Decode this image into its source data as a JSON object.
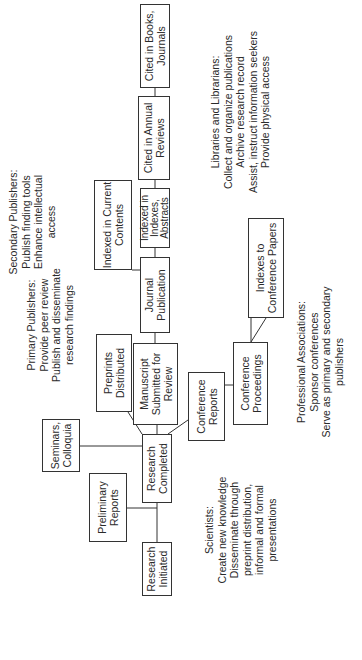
{
  "boxes": {
    "research_initiated": "Research Initiated",
    "preliminary_reports": "Preliminary Reports",
    "seminars": "Seminars, Colloquia",
    "research_completed": "Research Completed",
    "preprints": "Preprints Distributed",
    "manuscript": "Manuscript Submitted for Review",
    "conference_reports": "Conference Reports",
    "conference_proceedings": "Conference Proceedings",
    "indexes_conference": "Indexes to Conference Papers",
    "journal_publication": "Journal Publication",
    "current_contents": "Indexed in Current Contents",
    "indexes_abstracts": "Indexed in Indexes, Abstracts",
    "annual_reviews": "Cited in Annual Reviews",
    "books_journals": "Cited in Books, Journals"
  },
  "notes": {
    "scientists": {
      "title": "Scientists:",
      "lines": [
        "Create new knowledge",
        "Disseminate through",
        "preprint distribution,",
        "informal and formal",
        "presentations"
      ]
    },
    "primary": {
      "title": "Primary Publishers:",
      "lines": [
        "Provide peer review",
        "Publish and disseminate",
        "research findings"
      ]
    },
    "secondary": {
      "title": "Secondary Publishers:",
      "lines": [
        "Publish finding tools",
        "Enhance intellectual",
        "access"
      ]
    },
    "libraries": {
      "title": "Libraries and Librarians:",
      "lines": [
        "Collect and organize publications",
        "Archive research record",
        "Assist, instruct information seekers",
        "Provide physical access"
      ]
    },
    "associations": {
      "title": "Professional Associations:",
      "lines": [
        "Sponsor conferences",
        "Serve as primary and secondary",
        "publishers"
      ]
    }
  }
}
